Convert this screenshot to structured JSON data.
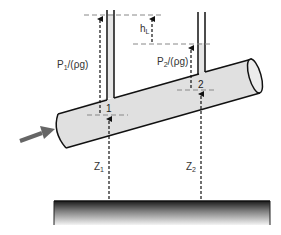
{
  "diagram": {
    "type": "bernoulli-pipe-head-loss",
    "labels": {
      "pressure_head_1": "P",
      "pressure_head_1_sub": "1",
      "pressure_head_1_rest": "/(ρg)",
      "pressure_head_2": "P",
      "pressure_head_2_sub": "2",
      "pressure_head_2_rest": "/(ρg)",
      "head_loss": "h",
      "head_loss_sub": "L",
      "point_1": "1",
      "point_2": "2",
      "elevation_1": "Z",
      "elevation_1_sub": "1",
      "elevation_2": "Z",
      "elevation_2_sub": "2"
    },
    "colors": {
      "pipe_fill": "#e0e0e0",
      "pipe_outline": "#111111",
      "flow_arrow": "#666666",
      "dashed_lines": "#888888",
      "ground_top": "#222222",
      "ground_bottom": "#f2f2f2"
    }
  }
}
